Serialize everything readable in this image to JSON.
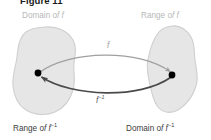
{
  "figure": {
    "title": "Figure 11",
    "caption_labels": {
      "top_left": "Domain of f",
      "top_right": "Range of f",
      "bottom_left": "Range of f⁻¹",
      "bottom_right": "Domain of f⁻¹"
    },
    "arrow_labels": {
      "forward": "f",
      "inverse": "f⁻¹"
    }
  },
  "diagram": {
    "type": "set-mapping-diagram",
    "sets": [
      {
        "name": "left-set",
        "top_label": "Domain of f",
        "bottom_label": "Range of f⁻¹",
        "point": {
          "x": 38,
          "y": 73
        }
      },
      {
        "name": "right-set",
        "top_label": "Range of f",
        "bottom_label": "Domain of f⁻¹",
        "point": {
          "x": 172,
          "y": 75
        }
      }
    ],
    "arrows": [
      {
        "name": "forward-arrow",
        "label": "f",
        "direction": "left-to-right",
        "from": "left-set",
        "to": "right-set",
        "curve": "arc-above",
        "color": "#a0a0a0"
      },
      {
        "name": "inverse-arrow",
        "label": "f⁻¹",
        "direction": "right-to-left",
        "from": "right-set",
        "to": "left-set",
        "curve": "arc-below",
        "color": "#4a4a4a"
      }
    ]
  },
  "colors": {
    "background": "#ffffff",
    "blob_fill": "#e6e6e6",
    "blob_stroke": "#cfcfcf",
    "point_fill": "#000000",
    "forward_arrow": "#a0a0a0",
    "inverse_arrow": "#4a4a4a",
    "label_top": "#b7b7b7",
    "label_bottom": "#3d3d3d",
    "title": "#1a1a1a"
  }
}
